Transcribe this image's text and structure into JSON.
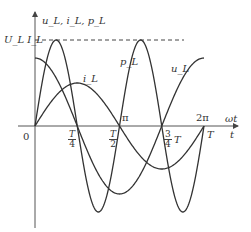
{
  "diagram": {
    "y_axis_label": "u_L, i_L, p_L",
    "x_axis_label_top": "ωt",
    "x_axis_label_bottom": "t",
    "peak_label": "U_L I_L",
    "origin_label": "0",
    "curve_labels": {
      "p": "p_L",
      "u": "u_L",
      "i": "i_L"
    },
    "ticks_top": [
      "π",
      "2π"
    ],
    "ticks_bottom": [
      {
        "num": "T",
        "den": "4"
      },
      {
        "num": "T",
        "den": "2"
      },
      {
        "num": "3",
        "den": "4",
        "suffix": "T"
      },
      {
        "label": "T"
      }
    ],
    "colors": {
      "line": "#333333",
      "axis": "#555555",
      "background": "#ffffff"
    }
  },
  "chart_data": {
    "type": "line",
    "title": "",
    "xlabel": "ωt / t",
    "ylabel": "u_L, i_L, p_L",
    "x_ticks": [
      "0",
      "T/4",
      "T/2",
      "3T/4",
      "T"
    ],
    "x_ticks_phase": [
      "0",
      "π/2",
      "π",
      "3π/2",
      "2π"
    ],
    "series": [
      {
        "name": "u_L",
        "shape": "cosine",
        "amplitude_rel": 0.78,
        "period": "T",
        "start_value": "max"
      },
      {
        "name": "i_L",
        "shape": "sine",
        "amplitude_rel": 0.5,
        "period": "T",
        "start_value": 0
      },
      {
        "name": "p_L",
        "shape": "sin(2ωt)",
        "amplitude": "U_L I_L",
        "period": "T/2"
      }
    ],
    "annotations": [
      "dashed line at U_L I_L (max of p_L)"
    ],
    "grid": false
  }
}
